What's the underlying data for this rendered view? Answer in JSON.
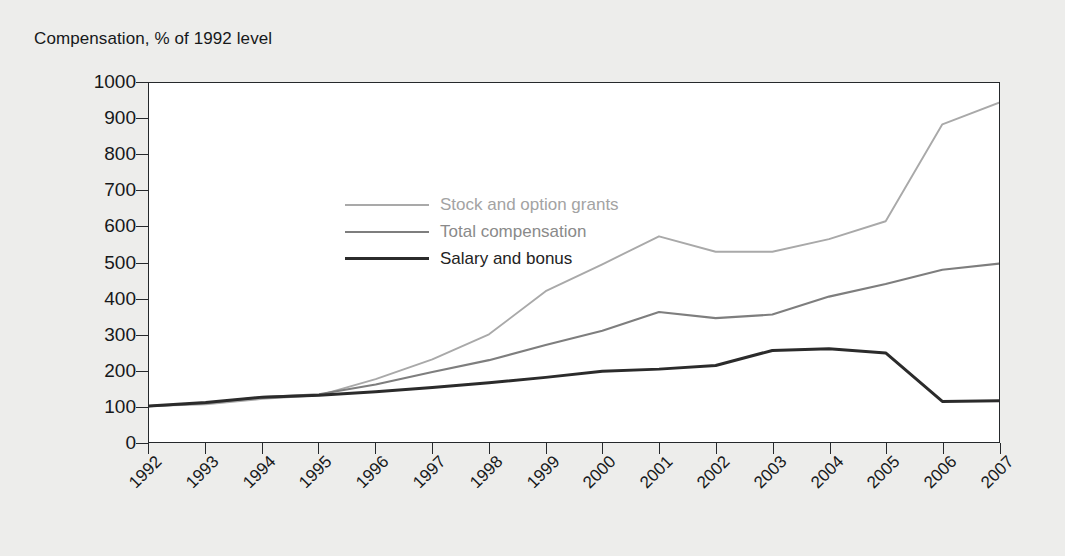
{
  "chart_data": {
    "type": "line",
    "title": "Compensation, % of 1992 level",
    "xlabel": "",
    "ylabel": "",
    "ylim": [
      0,
      1000
    ],
    "yticks": [
      0,
      100,
      200,
      300,
      400,
      500,
      600,
      700,
      800,
      900,
      1000
    ],
    "grid": false,
    "legend_position": "inside-top-left",
    "categories": [
      "1992",
      "1993",
      "1994",
      "1995",
      "1996",
      "1997",
      "1998",
      "1999",
      "2000",
      "2001",
      "2002",
      "2003",
      "2004",
      "2005",
      "2006",
      "2007"
    ],
    "series": [
      {
        "name": "Stock and option grants",
        "color": "#a9a9a9",
        "values": [
          100,
          105,
          120,
          130,
          175,
          230,
          300,
          420,
          495,
          573,
          530,
          530,
          565,
          615,
          885,
          945
        ]
      },
      {
        "name": "Total compensation",
        "color": "#7e7e7e",
        "values": [
          100,
          108,
          125,
          133,
          160,
          195,
          228,
          270,
          310,
          362,
          345,
          355,
          405,
          440,
          480,
          497
        ]
      },
      {
        "name": "Salary and bonus",
        "color": "#2b2b2b",
        "values": [
          100,
          110,
          125,
          130,
          140,
          152,
          165,
          180,
          197,
          203,
          213,
          255,
          260,
          248,
          113,
          115
        ]
      }
    ]
  },
  "colors": {
    "page_background": "#ededeb",
    "plot_background": "#ffffff",
    "axis": "#25282b",
    "text": "#16181a"
  }
}
